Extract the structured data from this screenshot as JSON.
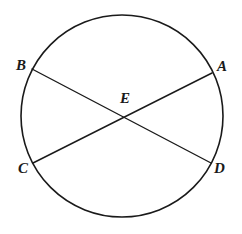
{
  "figure": {
    "kind": "geometry-diagram",
    "canvas": {
      "width": 242,
      "height": 234
    },
    "background_color": "#ffffff",
    "stroke_color": "#1a1a1a",
    "label_color": "#1a1a1a",
    "circle": {
      "center_x": 122,
      "center_y": 116,
      "radius": 101,
      "stroke_width": 1.6,
      "fill": "none"
    },
    "points": [
      {
        "id": "A",
        "label": "A",
        "x": 212,
        "y": 73,
        "label_x": 217,
        "label_y": 59,
        "on": "circle"
      },
      {
        "id": "B",
        "label": "B",
        "x": 32,
        "y": 69,
        "label_x": 16,
        "label_y": 58,
        "on": "circle"
      },
      {
        "id": "C",
        "label": "C",
        "x": 33,
        "y": 163,
        "label_x": 18,
        "label_y": 161,
        "on": "circle"
      },
      {
        "id": "D",
        "label": "D",
        "x": 211,
        "y": 163,
        "label_x": 214,
        "label_y": 161,
        "on": "circle"
      },
      {
        "id": "E",
        "label": "E",
        "x": 122,
        "y": 117,
        "label_x": 120,
        "label_y": 91,
        "on": "intersection"
      }
    ],
    "chords": [
      {
        "id": "BD",
        "from": "B",
        "to": "D",
        "x1": 32,
        "y1": 69,
        "x2": 211,
        "y2": 163,
        "stroke_width": 1.4
      },
      {
        "id": "CA",
        "from": "C",
        "to": "A",
        "x1": 33,
        "y1": 163,
        "x2": 212,
        "y2": 73,
        "stroke_width": 1.4
      }
    ]
  }
}
